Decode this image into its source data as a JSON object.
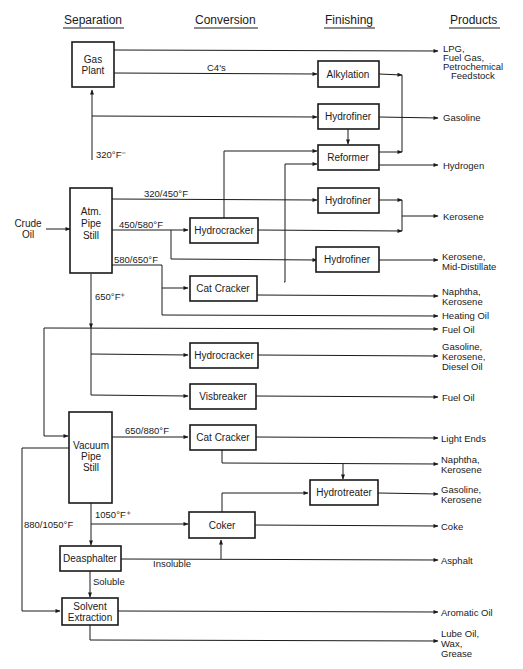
{
  "headers": {
    "separation": "Separation",
    "conversion": "Conversion",
    "finishing": "Finishing",
    "products": "Products"
  },
  "feed": {
    "line1": "Crude",
    "line2": "Oil"
  },
  "units": {
    "gas_plant": [
      "Gas",
      "Plant"
    ],
    "atm_pipe_still": [
      "Atm.",
      "Pipe",
      "Still"
    ],
    "vacuum_pipe_still": [
      "Vacuum",
      "Pipe",
      "Still"
    ],
    "deasphalter": "Deasphalter",
    "solvent_extraction": [
      "Solvent",
      "Extraction"
    ],
    "hydrocracker_1": "Hydrocracker",
    "cat_cracker_1": "Cat  Cracker",
    "hydrocracker_2": "Hydrocracker",
    "visbreaker": "Visbreaker",
    "cat_cracker_2": "Cat  Cracker",
    "coker": "Coker",
    "alkylation": "Alkylation",
    "hydrofiner_1": "Hydrofiner",
    "reformer": "Reformer",
    "hydrofiner_2": "Hydrofiner",
    "hydrofiner_3": "Hydrofiner",
    "hydrotreater": "Hydrotreater"
  },
  "stream_labels": {
    "c4s": "C4's",
    "cut_320_minus": "320°F⁻",
    "cut_320_450": "320/450°F",
    "cut_450_580": "450/580°F",
    "cut_580_650": "580/650°F",
    "cut_650_plus": "650°F⁺",
    "cut_650_880": "650/880°F",
    "cut_1050_plus": "1050°F⁺",
    "cut_880_1050": "880/1050°F",
    "insoluble": "Insoluble",
    "soluble": "Soluble"
  },
  "products": {
    "p1": [
      "LPG,",
      "Fuel  Gas,",
      "Petrochemical",
      "Feedstock"
    ],
    "p2": [
      "Gasoline"
    ],
    "p3": [
      "Hydrogen"
    ],
    "p4": [
      "Kerosene"
    ],
    "p5": [
      "Kerosene,",
      "Mid-Distillate"
    ],
    "p6": [
      "Naphtha,",
      "Kerosene"
    ],
    "p7": [
      "Heating  Oil"
    ],
    "p8": [
      "Fuel  Oil"
    ],
    "p9": [
      "Gasoline,",
      "Kerosene,",
      "Diesel  Oil"
    ],
    "p10": [
      "Fuel  Oil"
    ],
    "p11": [
      "Light  Ends"
    ],
    "p12": [
      "Naphtha,",
      "Kerosene"
    ],
    "p13": [
      "Gasoline,",
      "Kerosene"
    ],
    "p14": [
      "Coke"
    ],
    "p15": [
      "Asphalt"
    ],
    "p16": [
      "Aromatic  Oil"
    ],
    "p17": [
      "Lube  Oil,",
      "Wax,",
      "Grease"
    ]
  }
}
